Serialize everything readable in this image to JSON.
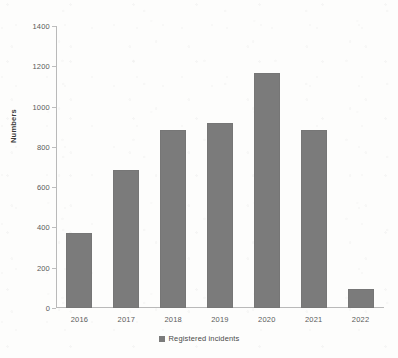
{
  "chart_data": {
    "type": "bar",
    "title": "",
    "xlabel": "",
    "ylabel": "Numbers",
    "categories": [
      "2016",
      "2017",
      "2018",
      "2019",
      "2020",
      "2021",
      "2022"
    ],
    "values": [
      372,
      685,
      884,
      918,
      1167,
      884,
      94
    ],
    "series": [
      {
        "name": "Registered incidents",
        "values": [
          372,
          685,
          884,
          918,
          1167,
          884,
          94
        ]
      }
    ],
    "ylim": [
      0,
      1400
    ],
    "ytick_step": 200,
    "yticks": [
      "1400",
      "1200",
      "1000",
      "800",
      "600",
      "400",
      "200",
      "0"
    ],
    "ytick_values": [
      1400,
      1200,
      1000,
      800,
      600,
      400,
      200,
      0
    ],
    "grid": false,
    "legend_position": "bottom",
    "legend": [
      "Registered incidents"
    ],
    "bar_color": "#7b7b7b",
    "axis_color": "#b9b9b9",
    "background_color": "#fdfdfc"
  },
  "legend": {
    "label": "Registered incidents"
  },
  "axes": {
    "y_title": "Numbers"
  }
}
